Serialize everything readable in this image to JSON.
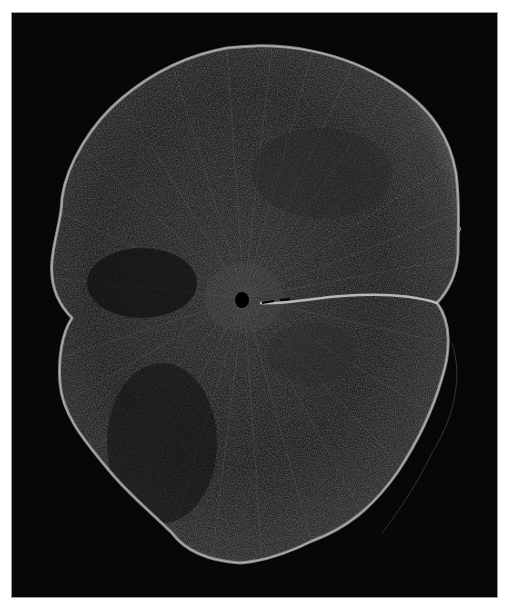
{
  "image": {
    "subject": "Grayscale micrograph of a tissue cross-section (spinal cord-like) on black background",
    "background_color": "#060606",
    "frame_border_color": "#9a9a9a",
    "page_background": "#ffffff",
    "tissue_fill_color": "#1c1c1c",
    "tissue_edge_color": "#a8a8a8",
    "fiber_color": "#8a8a8a",
    "central_canal_color": "#000000",
    "fissure_color": "#cfcfcf"
  }
}
